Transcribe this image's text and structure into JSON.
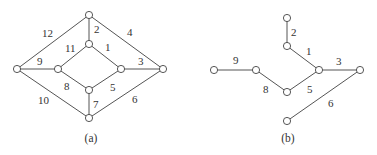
{
  "figures": [
    {
      "id": "a",
      "caption": "(a)",
      "caption_pos": [
        91,
        142
      ],
      "nodes": {
        "T": [
          89,
          15
        ],
        "IT": [
          89,
          44
        ],
        "L": [
          17,
          69
        ],
        "IL": [
          58,
          69
        ],
        "IR": [
          121,
          69
        ],
        "R": [
          163,
          69
        ],
        "IB": [
          89,
          90
        ],
        "B": [
          89,
          118
        ]
      },
      "edges": [
        {
          "from": "IT",
          "to": "IR",
          "label": "1",
          "lx": 105,
          "ly": 51
        },
        {
          "from": "T",
          "to": "IT",
          "label": "2",
          "lx": 94,
          "ly": 33
        },
        {
          "from": "IR",
          "to": "R",
          "label": "3",
          "lx": 138,
          "ly": 65
        },
        {
          "from": "T",
          "to": "R",
          "label": "4",
          "lx": 127,
          "ly": 36
        },
        {
          "from": "IR",
          "to": "IB",
          "label": "5",
          "lx": 110,
          "ly": 91
        },
        {
          "from": "R",
          "to": "B",
          "label": "6",
          "lx": 132,
          "ly": 103
        },
        {
          "from": "IB",
          "to": "B",
          "label": "7",
          "lx": 93,
          "ly": 108
        },
        {
          "from": "IL",
          "to": "IB",
          "label": "8",
          "lx": 64,
          "ly": 90
        },
        {
          "from": "L",
          "to": "IL",
          "label": "9",
          "lx": 37,
          "ly": 65
        },
        {
          "from": "L",
          "to": "B",
          "label": "10",
          "lx": 38,
          "ly": 104
        },
        {
          "from": "IL",
          "to": "IT",
          "label": "11",
          "lx": 65,
          "ly": 52
        },
        {
          "from": "L",
          "to": "T",
          "label": "12",
          "lx": 42,
          "ly": 37
        }
      ]
    },
    {
      "id": "b",
      "caption": "(b)",
      "caption_pos": [
        288,
        142
      ],
      "nodes": {
        "T": [
          287,
          18
        ],
        "U": [
          287,
          46
        ],
        "FL": [
          214,
          70
        ],
        "ML": [
          256,
          70
        ],
        "H": [
          319,
          70
        ],
        "R": [
          360,
          70
        ],
        "D": [
          287,
          92
        ],
        "B": [
          287,
          121
        ]
      },
      "edges": [
        {
          "from": "U",
          "to": "H",
          "label": "1",
          "lx": 306,
          "ly": 55
        },
        {
          "from": "T",
          "to": "U",
          "label": "2",
          "lx": 291,
          "ly": 36
        },
        {
          "from": "H",
          "to": "R",
          "label": "3",
          "lx": 336,
          "ly": 65
        },
        {
          "from": "D",
          "to": "H",
          "label": "5",
          "lx": 307,
          "ly": 93
        },
        {
          "from": "R",
          "to": "B",
          "label": "6",
          "lx": 328,
          "ly": 107
        },
        {
          "from": "ML",
          "to": "D",
          "label": "8",
          "lx": 263,
          "ly": 93
        },
        {
          "from": "FL",
          "to": "ML",
          "label": "9",
          "lx": 233,
          "ly": 64
        }
      ]
    }
  ],
  "style": {
    "edge_color": "#555555",
    "node_stroke": "#444444",
    "node_fill": "#ffffff",
    "text_color": "#333333",
    "node_radius": 3.6
  }
}
